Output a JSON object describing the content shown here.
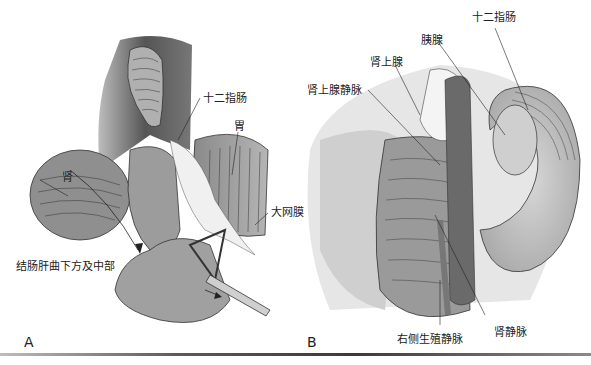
{
  "figure": {
    "panels": [
      {
        "id": "A",
        "label": "A",
        "annotations": {
          "duodenum": "十二指肠",
          "stomach": "胃",
          "kidney": "肾",
          "greater_omentum": "大网膜",
          "hepatic_flexure": "结肠肝曲下方及中部"
        }
      },
      {
        "id": "B",
        "label": "B",
        "annotations": {
          "duodenum": "十二指肠",
          "pancreas": "胰腺",
          "adrenal_gland": "肾上腺",
          "adrenal_vein": "肾上腺静脉",
          "renal_vein": "肾静脉",
          "right_gonadal_vein": "右侧生殖静脉"
        }
      }
    ]
  },
  "colors": {
    "organ_dark": "#5a5a5a",
    "organ_mid": "#9a9a9a",
    "organ_light": "#c8c8c8",
    "line": "#222222"
  }
}
